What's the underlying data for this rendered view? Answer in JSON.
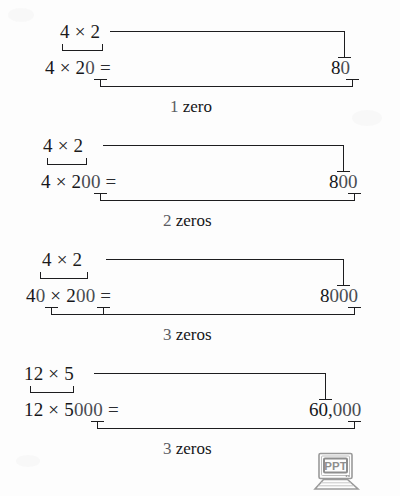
{
  "document": {
    "type": "math-worksheet-diagram",
    "topic": "Multiplying with trailing zeros",
    "background_color": "#fdfdfd",
    "ink_color": "#1d1d1f",
    "faded_ink_color": "#4a4c52"
  },
  "examples": [
    {
      "id": "example-1",
      "basic_fact": "4 × 2",
      "problem_lead": "4 × 2",
      "problem_trailing_zeros": "0",
      "equals_sign": "=",
      "answer_lead": "8",
      "answer_trailing_zeros": "0",
      "answer_full": "80",
      "zeros_label_count": "1",
      "zeros_label_word": "zero"
    },
    {
      "id": "example-2",
      "basic_fact": "4 × 2",
      "problem_lead": "4 × 2",
      "problem_trailing_zeros": "00",
      "equals_sign": "=",
      "answer_lead": "8",
      "answer_trailing_zeros": "00",
      "answer_full": "800",
      "zeros_label_count": "2",
      "zeros_label_word": "zeros"
    },
    {
      "id": "example-3",
      "basic_fact": "4 × 2",
      "problem_lead_a": "4",
      "problem_zero_a": "0",
      "problem_times": " × ",
      "problem_lead_b": "2",
      "problem_zeros_b": "00",
      "equals_sign": "=",
      "answer_lead": "8",
      "answer_trailing_zeros": "000",
      "answer_full": "8000",
      "zeros_label_count": "3",
      "zeros_label_word": "zeros"
    },
    {
      "id": "example-4",
      "basic_fact": "12 × 5",
      "problem_lead": "12 × 5",
      "problem_trailing_zeros": "000",
      "equals_sign": "=",
      "answer_lead": "60,",
      "answer_trailing_zeros": "000",
      "answer_full": "60,000",
      "zeros_label_count": "3",
      "zeros_label_word": "zeros"
    }
  ],
  "watermark": {
    "label": "PPT",
    "icon": "laptop-icon",
    "color": "#8e8e8e"
  }
}
